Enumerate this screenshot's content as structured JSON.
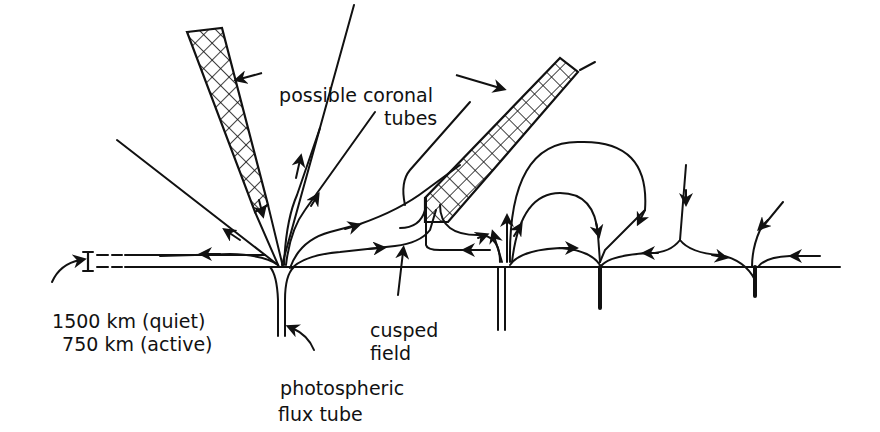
{
  "diagram": {
    "type": "magnetic field line schematic",
    "colors": {
      "ink": "#111111",
      "background": "#ffffff"
    },
    "labels": {
      "coronal_tubes_line1": "possible coronal",
      "coronal_tubes_line2": "tubes",
      "height_quiet": "1500 km (quiet)",
      "height_active": "750 km (active)",
      "cusped_line1": "cusped",
      "cusped_line2": "field",
      "flux_tube_line1": "photospheric",
      "flux_tube_line2": "flux tube"
    },
    "elements": [
      {
        "name": "photosphere-line",
        "desc": "horizontal baseline"
      },
      {
        "name": "height-marker",
        "desc": "I-shaped bar with dashed extensions"
      },
      {
        "name": "coronal-tube-left",
        "desc": "cross-hatched vertical tube"
      },
      {
        "name": "coronal-tube-right",
        "desc": "cross-hatched diagonal tube"
      },
      {
        "name": "photospheric-flux-tube",
        "desc": "narrow vertical tube below baseline"
      },
      {
        "name": "closed-loops",
        "desc": "arched field lines with arrows"
      }
    ]
  }
}
